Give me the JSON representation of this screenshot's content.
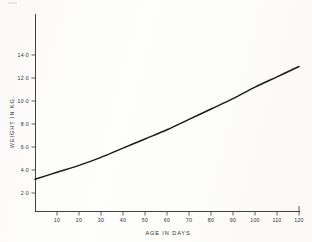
{
  "chart_data": {
    "type": "line",
    "title": "",
    "xlabel": "AGE IN DAYS",
    "ylabel": "WEIGHT IN KG.",
    "xlim": [
      0,
      122
    ],
    "ylim": [
      0,
      15.2
    ],
    "grid": false,
    "legend": null,
    "x_ticks": [
      10,
      20,
      30,
      40,
      50,
      60,
      70,
      80,
      90,
      100,
      110,
      120
    ],
    "x_tick_labels": [
      "10",
      "20",
      "30",
      "40",
      "50",
      "60",
      "70",
      "80",
      "90",
      "100",
      "110",
      "120"
    ],
    "y_ticks": [
      2.0,
      4.0,
      6.0,
      8.0,
      10.0,
      12.0,
      14.0
    ],
    "y_tick_labels": [
      "2·0",
      "4·0",
      "6·0",
      "8·0",
      "10·0",
      "12·0",
      "14·0"
    ],
    "series": [
      {
        "name": "Weight for age",
        "x": [
          0,
          10,
          20,
          30,
          40,
          50,
          60,
          70,
          80,
          90,
          100,
          110,
          120
        ],
        "values": [
          3.2,
          3.8,
          4.4,
          5.1,
          5.9,
          6.7,
          7.5,
          8.4,
          9.3,
          10.2,
          11.2,
          12.1,
          13.0
        ]
      }
    ]
  },
  "figure": {
    "axis_color": "#2b2b2b",
    "curve_color": "#1a1a1a",
    "background_color": "#fdfdfc"
  }
}
